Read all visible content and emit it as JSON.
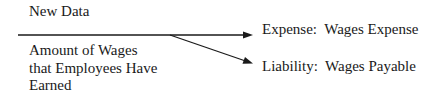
{
  "diagram": {
    "header_label": "New Data",
    "input_lines": [
      "Amount of Wages",
      "that Employees Have",
      "Earned"
    ],
    "outputs": [
      {
        "category": "Expense:",
        "account": "Wages Expense",
        "full": "Expense:  Wages Expense"
      },
      {
        "category": "Liability:",
        "account": "Wages Payable",
        "full": "Liability:  Wages Payable"
      }
    ],
    "colors": {
      "line": "#1a1a1a",
      "text": "#1a1a1a",
      "background": "#ffffff"
    }
  }
}
